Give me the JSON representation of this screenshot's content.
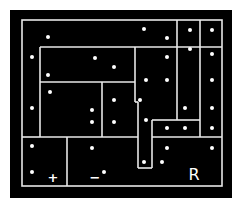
{
  "game": {
    "title": "Puzzle board",
    "colors": {
      "background": "#000000",
      "lines": "#e8e8e8",
      "dots": "#ffffff"
    },
    "labels": {
      "plus": "+",
      "minus": "−",
      "region": "R"
    }
  },
  "board": {
    "border": [
      22,
      20,
      222,
      186
    ],
    "lines": [
      [
        40,
        47,
        222,
        47
      ],
      [
        40,
        47,
        40,
        137
      ],
      [
        22,
        137,
        40,
        137
      ],
      [
        40,
        82,
        135,
        82
      ],
      [
        102,
        82,
        102,
        137
      ],
      [
        40,
        137,
        138,
        137
      ],
      [
        67,
        137,
        67,
        186
      ],
      [
        135,
        47,
        135,
        102
      ],
      [
        177,
        20,
        177,
        47
      ],
      [
        200,
        20,
        200,
        137
      ],
      [
        177,
        47,
        177,
        120
      ],
      [
        152,
        120,
        177,
        120
      ],
      [
        152,
        120,
        152,
        168
      ],
      [
        138,
        102,
        138,
        168
      ],
      [
        138,
        168,
        152,
        168
      ],
      [
        135,
        102,
        138,
        102
      ],
      [
        152,
        137,
        222,
        137
      ],
      [
        177,
        120,
        200,
        120
      ]
    ],
    "dots": [
      [
        48,
        37
      ],
      [
        32,
        57
      ],
      [
        48,
        75
      ],
      [
        95,
        58
      ],
      [
        114,
        67
      ],
      [
        144,
        29
      ],
      [
        167,
        38
      ],
      [
        190,
        30
      ],
      [
        212,
        30
      ],
      [
        190,
        49
      ],
      [
        212,
        54
      ],
      [
        167,
        57
      ],
      [
        212,
        80
      ],
      [
        146,
        80
      ],
      [
        167,
        80
      ],
      [
        114,
        100
      ],
      [
        140,
        100
      ],
      [
        50,
        92
      ],
      [
        92,
        110
      ],
      [
        32,
        108
      ],
      [
        114,
        122
      ],
      [
        92,
        122
      ],
      [
        146,
        120
      ],
      [
        185,
        108
      ],
      [
        212,
        108
      ],
      [
        167,
        128
      ],
      [
        185,
        128
      ],
      [
        212,
        128
      ],
      [
        32,
        146
      ],
      [
        92,
        148
      ],
      [
        167,
        148
      ],
      [
        212,
        148
      ],
      [
        32,
        172
      ],
      [
        104,
        172
      ],
      [
        144,
        162
      ],
      [
        162,
        162
      ]
    ]
  }
}
